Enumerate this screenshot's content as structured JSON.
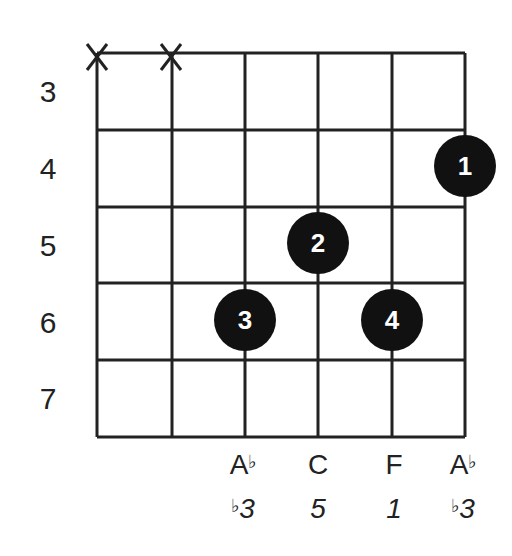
{
  "diagram": {
    "type": "guitar-chord-diagram",
    "strings": 6,
    "fret_labels": [
      "3",
      "4",
      "5",
      "6",
      "7"
    ],
    "muted_strings": [
      1,
      2
    ],
    "muted_symbol": "X",
    "fingers": [
      {
        "finger": "1",
        "string": 6,
        "fret": 4
      },
      {
        "finger": "2",
        "string": 4,
        "fret": 5
      },
      {
        "finger": "3",
        "string": 3,
        "fret": 6
      },
      {
        "finger": "4",
        "string": 5,
        "fret": 6
      }
    ],
    "notes": [
      {
        "string": 3,
        "note": "A",
        "accidental": "♭",
        "interval": "3",
        "interval_accidental": "♭"
      },
      {
        "string": 4,
        "note": "C",
        "accidental": "",
        "interval": "5",
        "interval_accidental": ""
      },
      {
        "string": 5,
        "note": "F",
        "accidental": "",
        "interval": "1",
        "interval_accidental": ""
      },
      {
        "string": 6,
        "note": "A",
        "accidental": "♭",
        "interval": "3",
        "interval_accidental": "♭"
      }
    ],
    "colors": {
      "line": "#222222",
      "dot": "#111111",
      "dot_text": "#ffffff",
      "background": "#ffffff"
    }
  }
}
